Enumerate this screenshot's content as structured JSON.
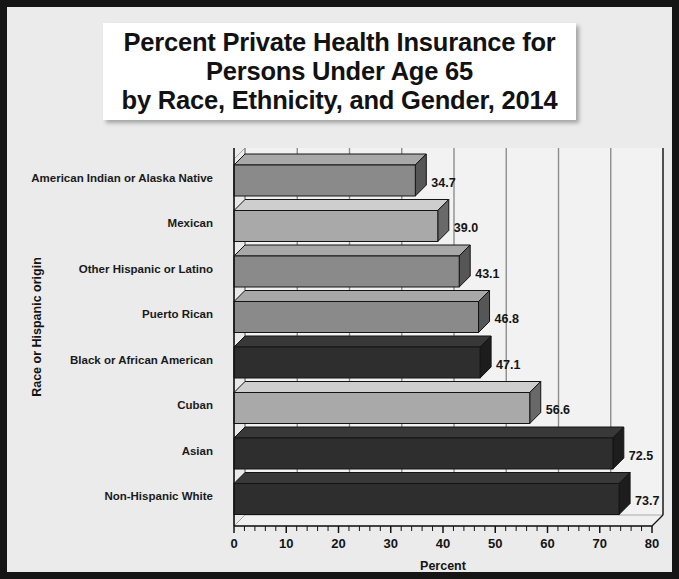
{
  "title": "Percent Private Health Insurance for\nPersons Under Age 65\nby Race, Ethnicity, and Gender, 2014",
  "axis": {
    "x_title": "Percent",
    "y_title": "Race or Hispanic origin"
  },
  "ticks": [
    "0",
    "10",
    "20",
    "30",
    "40",
    "50",
    "60",
    "70",
    "80"
  ],
  "colors": {
    "page_background": "#ebebeb",
    "border": "#151515",
    "title_background": "#ffffff",
    "plot_background": "#f2f2f2",
    "gridline": "#8d8d8d",
    "bar_medium_gray": "#8a8a8a",
    "bar_light_gray": "#a9a9a9",
    "bar_dark": "#2e2e2e",
    "text": "#141414"
  },
  "chart_data": {
    "type": "bar",
    "orientation": "horizontal",
    "title": "Percent Private Health Insurance for Persons Under Age 65 by Race, Ethnicity, and Gender, 2014",
    "xlabel": "Percent",
    "ylabel": "Race or Hispanic origin",
    "xlim": [
      0,
      80
    ],
    "xticks": [
      0,
      10,
      20,
      30,
      40,
      50,
      60,
      70,
      80
    ],
    "minor_tick_step": 2,
    "grid": "vertical-major",
    "legend": "none",
    "categories": [
      "American Indian or Alaska Native",
      "Mexican",
      "Other Hispanic or Latino",
      "Puerto Rican",
      "Black or African American",
      "Cuban",
      "Asian",
      "Non-Hispanic White"
    ],
    "values": [
      34.7,
      39.0,
      43.1,
      46.8,
      47.1,
      56.6,
      72.5,
      73.7
    ],
    "value_labels": [
      "34.7",
      "39.0",
      "43.1",
      "46.8",
      "47.1",
      "56.6",
      "72.5",
      "73.7"
    ],
    "bar_colors": [
      "#8a8a8a",
      "#a9a9a9",
      "#8a8a8a",
      "#8a8a8a",
      "#2e2e2e",
      "#a9a9a9",
      "#2e2e2e",
      "#2e2e2e"
    ]
  }
}
